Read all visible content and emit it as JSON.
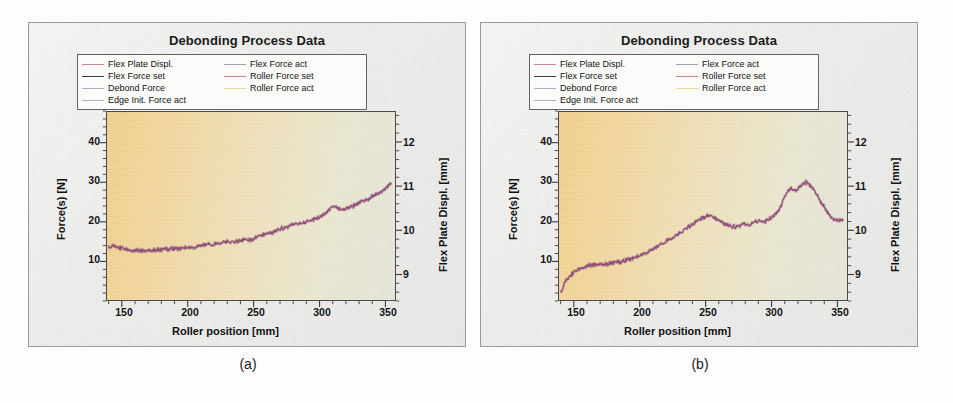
{
  "figure": {
    "background_color": "#fdfdfd",
    "panel_background": "#eeeeec",
    "panel_border_color": "#9a9a9a"
  },
  "panels": [
    {
      "id": "a",
      "caption": "(a)",
      "title": "Debonding Process Data"
    },
    {
      "id": "b",
      "caption": "(b)",
      "title": "Debonding Process Data"
    }
  ],
  "legend": {
    "entries": [
      {
        "label": "Flex Plate Displ.",
        "color": "#c48a9a"
      },
      {
        "label": "Flex Force act",
        "color": "#9aa2b4"
      },
      {
        "label": "Flex Force set",
        "color": "#3b3f46"
      },
      {
        "label": "Roller Force set",
        "color": "#d4818f"
      },
      {
        "label": "Debond Force",
        "color": "#a9b0bd"
      },
      {
        "label": "Roller Force act",
        "color": "#e8d79a"
      },
      {
        "label": "Edge Init. Force act",
        "color": "#aeb4bf"
      }
    ]
  },
  "axes": {
    "x": {
      "label": "Roller position [mm]",
      "ticks": [
        150,
        200,
        250,
        300,
        350
      ],
      "tick_labels": [
        "150",
        "200",
        "250",
        "300",
        "350"
      ],
      "min": 138,
      "max": 358,
      "minor_per_major": 5
    },
    "y_left": {
      "label": "Force(s) [N]",
      "ticks": [
        10,
        20,
        30,
        40
      ],
      "tick_labels": [
        "10",
        "20",
        "30",
        "40"
      ],
      "min": 0,
      "max": 48,
      "minor_per_major": 5
    },
    "y_right": {
      "label": "Flex Plate Displ. [mm]",
      "ticks": [
        9,
        10,
        11,
        12
      ],
      "tick_labels": [
        "9",
        "10",
        "11",
        "12"
      ],
      "min": 8.4,
      "max": 12.7,
      "minor_per_major": 5
    }
  },
  "chart_data": [
    {
      "type": "line",
      "panel": "a",
      "title": "Debonding Process Data",
      "xlabel": "Roller position [mm]",
      "ylabel": "Force(s) [N]",
      "ylabel_secondary": "Flex Plate Displ. [mm]",
      "xlim": [
        138,
        358
      ],
      "ylim": [
        0,
        48
      ],
      "ylim_secondary": [
        8.4,
        12.7
      ],
      "grid": false,
      "legend_position": "above-plot",
      "series": [
        {
          "name": "Roller Force act",
          "color": "#8e4e78",
          "x": [
            139,
            143,
            147,
            151,
            155,
            159,
            163,
            167,
            171,
            175,
            179,
            183,
            187,
            191,
            195,
            199,
            203,
            207,
            211,
            215,
            219,
            223,
            227,
            231,
            235,
            239,
            243,
            247,
            251,
            255,
            259,
            263,
            267,
            271,
            275,
            279,
            283,
            287,
            291,
            295,
            299,
            303,
            307,
            311,
            315,
            319,
            323,
            327,
            331,
            335,
            339,
            343,
            347,
            351,
            355
          ],
          "y": [
            13.8,
            13.6,
            13.4,
            13.2,
            12.9,
            12.7,
            12.6,
            12.5,
            12.6,
            12.8,
            12.7,
            12.9,
            13.1,
            13.0,
            13.3,
            13.5,
            13.4,
            13.7,
            14.0,
            14.2,
            14.1,
            14.5,
            14.8,
            15.0,
            14.7,
            15.2,
            15.5,
            15.3,
            15.8,
            16.4,
            16.9,
            17.2,
            17.6,
            18.2,
            18.6,
            19.1,
            19.7,
            19.4,
            20.2,
            20.6,
            21.0,
            21.5,
            22.8,
            23.9,
            23.4,
            23.1,
            23.6,
            24.2,
            24.8,
            25.4,
            26.1,
            26.8,
            27.6,
            28.4,
            30.0
          ]
        }
      ],
      "annotations": []
    },
    {
      "type": "line",
      "panel": "b",
      "title": "Debonding Process Data",
      "xlabel": "Roller position [mm]",
      "ylabel": "Force(s) [N]",
      "ylabel_secondary": "Flex Plate Displ. [mm]",
      "xlim": [
        138,
        358
      ],
      "ylim": [
        0,
        48
      ],
      "ylim_secondary": [
        8.4,
        12.7
      ],
      "grid": false,
      "legend_position": "above-plot",
      "series": [
        {
          "name": "Roller Force act",
          "color": "#8e4e78",
          "x": [
            139,
            143,
            147,
            151,
            155,
            159,
            163,
            167,
            171,
            175,
            179,
            183,
            187,
            191,
            195,
            199,
            203,
            207,
            211,
            215,
            219,
            223,
            227,
            231,
            235,
            239,
            243,
            247,
            251,
            255,
            259,
            263,
            267,
            271,
            275,
            279,
            283,
            287,
            291,
            295,
            299,
            303,
            307,
            311,
            315,
            319,
            323,
            327,
            331,
            335,
            339,
            343,
            347,
            351,
            355
          ],
          "y": [
            2.0,
            4.6,
            6.4,
            7.6,
            8.3,
            8.7,
            8.9,
            9.0,
            9.1,
            9.2,
            9.4,
            9.6,
            9.9,
            10.3,
            10.8,
            11.3,
            11.9,
            12.5,
            13.2,
            14.0,
            14.8,
            15.6,
            16.4,
            17.3,
            18.2,
            19.2,
            20.1,
            20.9,
            21.5,
            21.3,
            20.6,
            19.8,
            19.1,
            18.6,
            18.9,
            19.4,
            19.2,
            19.8,
            20.3,
            20.1,
            20.8,
            21.6,
            23.5,
            26.8,
            28.6,
            27.9,
            29.2,
            30.2,
            28.7,
            26.9,
            24.6,
            22.3,
            20.8,
            20.2,
            20.6
          ]
        }
      ],
      "annotations": []
    }
  ]
}
